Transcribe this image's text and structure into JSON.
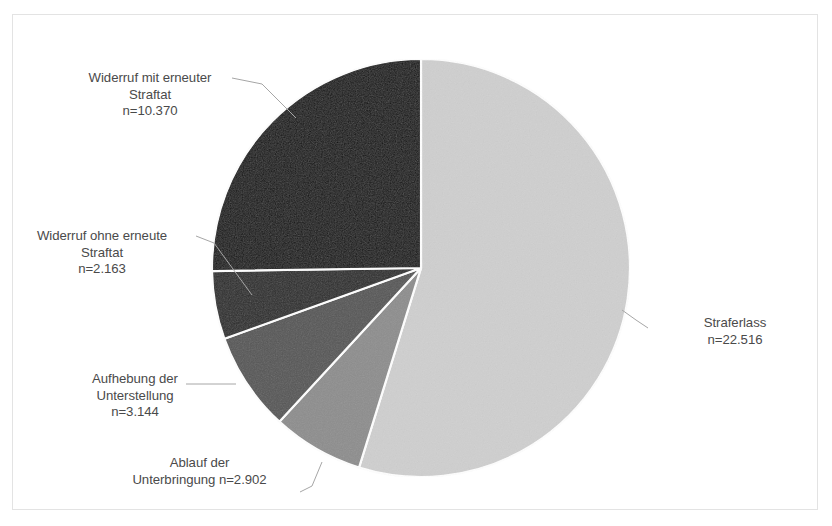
{
  "chart_data": {
    "type": "pie",
    "title": "",
    "total": 41095,
    "legend_position": "none",
    "grid": false,
    "start_angle_deg": 0,
    "direction": "clockwise",
    "categories": [
      "Straferlass",
      "Ablauf der Unterbringung",
      "Aufhebung der Unterstellung",
      "Widerruf ohne erneute Straftat",
      "Widerruf mit erneuter Straftat"
    ],
    "values": [
      22516,
      2902,
      3144,
      2163,
      10370
    ],
    "colors": [
      "#cfcfcf",
      "#8d8d8d",
      "#565656",
      "#2b2b2b",
      "#141414"
    ],
    "slice_border_color": "#ffffff",
    "slices": [
      {
        "name": "Straferlass",
        "value": 22516,
        "value_text": "n=22.516",
        "percent": 54.8,
        "color": "#cfcfcf",
        "start_deg": 0,
        "end_deg": 197.25
      },
      {
        "name": "Ablauf der Unterbringung",
        "value": 2902,
        "value_text": "n=2.902",
        "percent": 7.1,
        "color": "#8d8d8d",
        "start_deg": 197.25,
        "end_deg": 222.67
      },
      {
        "name": "Aufhebung der Unterstellung",
        "value": 3144,
        "value_text": "n=3.144",
        "percent": 7.7,
        "color": "#565656",
        "start_deg": 222.67,
        "end_deg": 250.22
      },
      {
        "name": "Widerruf ohne erneute Straftat",
        "value": 2163,
        "value_text": "n=2.163",
        "percent": 5.3,
        "color": "#2b2b2b",
        "start_deg": 250.22,
        "end_deg": 269.17
      },
      {
        "name": "Widerruf mit erneuter Straftat",
        "value": 10370,
        "value_text": "n=10.370",
        "percent": 25.2,
        "color": "#141414",
        "start_deg": 269.17,
        "end_deg": 360
      }
    ],
    "xlabel": "",
    "ylabel": ""
  },
  "labels": {
    "widerruf_mit": {
      "line1": "Widerruf mit erneuter",
      "line2": "Straftat",
      "line3": "n=10.370"
    },
    "widerruf_ohne": {
      "line1": "Widerruf ohne erneute",
      "line2": "Straftat",
      "line3": "n=2.163"
    },
    "aufhebung": {
      "line1": "Aufhebung der",
      "line2": "Unterstellung",
      "line3": "n=3.144"
    },
    "ablauf": {
      "line1": "Ablauf der",
      "line2": "Unterbringung n=2.902",
      "line3": ""
    },
    "straferlass": {
      "line1": "Straferlass",
      "line2": "n=22.516",
      "line3": ""
    }
  },
  "style": {
    "text_color": "#4a4a4a",
    "leader_line_color": "#a6a6a6",
    "frame_color": "#e3e3e3",
    "background": "#ffffff"
  }
}
